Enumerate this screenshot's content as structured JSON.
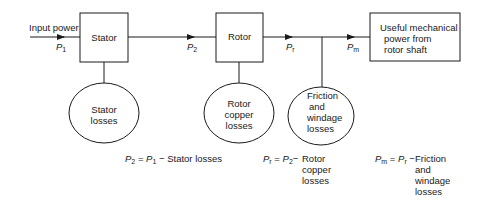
{
  "diagram": {
    "type": "power-flow-block-diagram",
    "input": {
      "label": "Input power",
      "symbol": "P",
      "subscript": "1"
    },
    "blocks": [
      {
        "id": "stator",
        "label": "Stator"
      },
      {
        "id": "rotor",
        "label": "Rotor"
      },
      {
        "id": "output",
        "lines": [
          "Useful mechanical",
          "power from",
          "rotor shaft"
        ]
      }
    ],
    "flows": [
      {
        "symbol": "P",
        "subscript": "2"
      },
      {
        "symbol": "P",
        "subscript": "r"
      },
      {
        "symbol": "P",
        "subscript": "m"
      }
    ],
    "losses": [
      {
        "id": "stator-losses",
        "lines": [
          "Stator",
          "losses"
        ]
      },
      {
        "id": "rotor-copper-losses",
        "lines": [
          "Rotor",
          "copper",
          "losses"
        ]
      },
      {
        "id": "friction-windage-losses",
        "lines": [
          "Friction",
          "and",
          "windage",
          "losses"
        ]
      }
    ],
    "equations": [
      {
        "lhs_sym": "P",
        "lhs_sub": "2",
        "op": "=",
        "rhs_sym": "P",
        "rhs_sub": "1",
        "minus": "−",
        "terms": [
          "Stator losses"
        ]
      },
      {
        "lhs_sym": "P",
        "lhs_sub": "r",
        "op": "=",
        "rhs_sym": "P",
        "rhs_sub": "2",
        "minus": "−",
        "terms": [
          "Rotor",
          "copper",
          "losses"
        ]
      },
      {
        "lhs_sym": "P",
        "lhs_sub": "m",
        "op": "=",
        "rhs_sym": "P",
        "rhs_sub": "r",
        "minus": "−",
        "terms": [
          "Friction",
          "and",
          "windage",
          "losses"
        ]
      }
    ],
    "colors": {
      "stroke": "#1a1a1a",
      "background": "#ffffff"
    }
  }
}
